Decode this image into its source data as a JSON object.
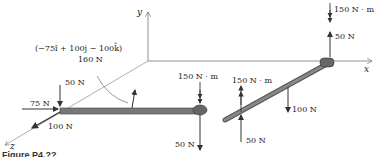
{
  "diagram": {
    "axes": {
      "x": "x",
      "y": "y",
      "z": "z"
    },
    "left_bar": {
      "force_vector": "(−75î + 100ĵ − 100k̂)",
      "force_vector_magnitude": "160 N",
      "load_down": "50 N",
      "load_x": "75 N",
      "load_z": "100 N",
      "end_moment": "150 N · m",
      "end_load": "50 N"
    },
    "right_bar": {
      "top_moment": "150 N · m",
      "top_load": "50 N",
      "mid_moment": "150 N · m",
      "mid_load_up": "50 N",
      "mid_load_down": "100 N"
    },
    "caption": "Figure P4.??"
  }
}
